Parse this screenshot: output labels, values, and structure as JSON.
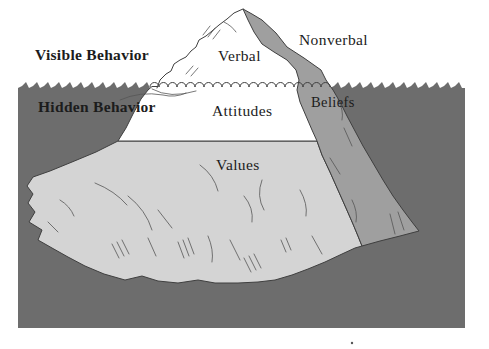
{
  "figure": {
    "type": "iceberg-model-diagram",
    "zones": {
      "visible": "Visible Behavior",
      "hidden": "Hidden Behavior"
    },
    "sections": {
      "verbal": "Verbal",
      "nonverbal": "Nonverbal",
      "attitudes": "Attitudes",
      "beliefs": "Beliefs",
      "values": "Values"
    }
  },
  "colors": {
    "background": "#ffffff",
    "water": "#6d6d6d",
    "iceberg_light": "#d4d4d4",
    "iceberg_shadow": "#9f9f9f",
    "iceberg_white": "#ffffff",
    "outline": "#3f3f3f",
    "crack": "#555555",
    "text": "#1c1c1c"
  }
}
